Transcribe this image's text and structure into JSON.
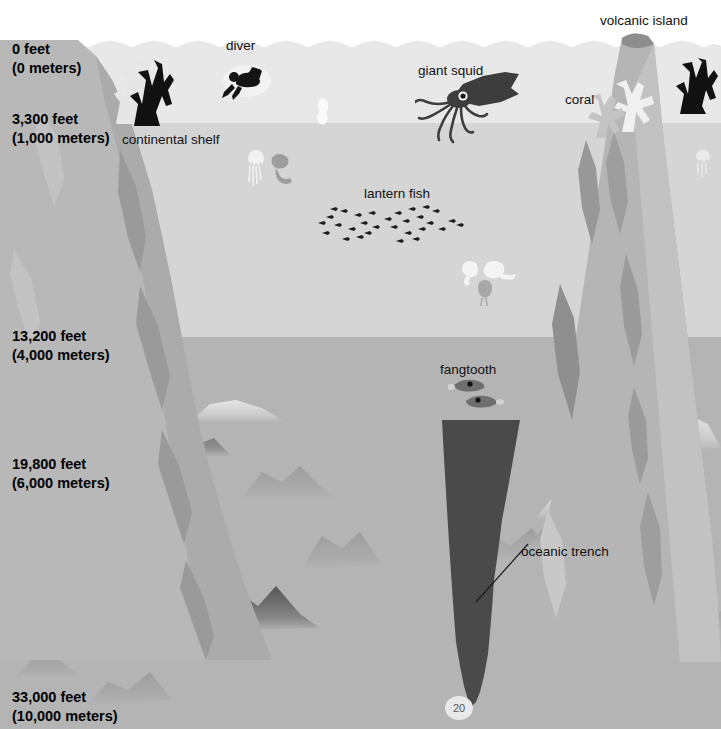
{
  "diagram": {
    "page_number": "20",
    "width": 721,
    "height": 729
  },
  "depth_scale": [
    {
      "id": "depth-0",
      "feet": "0 feet",
      "meters": "(0 meters)",
      "feet_value": 0,
      "meters_value": 0
    },
    {
      "id": "depth-3300",
      "feet": "3,300 feet",
      "meters": "(1,000 meters)",
      "feet_value": 3300,
      "meters_value": 1000
    },
    {
      "id": "depth-13200",
      "feet": "13,200 feet",
      "meters": "(4,000 meters)",
      "feet_value": 13200,
      "meters_value": 4000
    },
    {
      "id": "depth-19800",
      "feet": "19,800 feet",
      "meters": "(6,000 meters)",
      "feet_value": 19800,
      "meters_value": 6000
    },
    {
      "id": "depth-33000",
      "feet": "33,000 feet",
      "meters": "(10,000 meters)",
      "feet_value": 33000,
      "meters_value": 10000
    }
  ],
  "labels": {
    "volcanic_island": "volcanic island",
    "diver": "diver",
    "giant_squid": "giant squid",
    "coral": "coral",
    "continental_shelf_line1": "continental",
    "continental_shelf_line2": "shelf",
    "lantern_fish": "lantern fish",
    "fangtooth": "fangtooth",
    "oceanic_trench_line1": "oceanic",
    "oceanic_trench_line2": "trench"
  },
  "colors": {
    "sky": "#ffffff",
    "sunlight_zone": "#e8e8e8",
    "twilight_zone": "#d5d5d5",
    "midnight_zone": "#b4b4b4",
    "landform_light": "#c0c0c0",
    "landform_mid": "#ababab",
    "landform_shadow": "#9a9a9a",
    "trench_dark": "#4a4a4a",
    "creature_dark": "#1a1a1a",
    "creature_white": "#f4f4f4",
    "text": "#111111"
  },
  "zones": [
    {
      "name": "sky",
      "top": 0,
      "height": 47,
      "color": "#ffffff"
    },
    {
      "name": "sunlight-zone",
      "top": 47,
      "height": 76,
      "color": "#e8e8e8"
    },
    {
      "name": "twilight-zone",
      "top": 123,
      "height": 214,
      "color": "#d5d5d5"
    },
    {
      "name": "midnight-zone",
      "top": 337,
      "height": 392,
      "color": "#b4b4b4"
    }
  ]
}
